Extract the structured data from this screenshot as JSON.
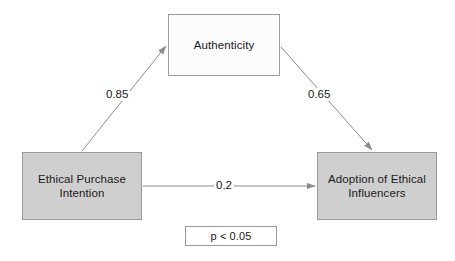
{
  "diagram": {
    "type": "path-diagram",
    "background_color": "#ffffff",
    "node_fill_shaded": "#cfcfcf",
    "node_fill_light": "#fbfbfb",
    "node_border_color": "#9a9a9a",
    "edge_color": "#8c8c8c",
    "text_color": "#1a1a1a",
    "nodes": [
      {
        "id": "authenticity",
        "label": "Authenticity",
        "role": "mediator"
      },
      {
        "id": "ethical_purchase_intention",
        "label": "Ethical Purchase\nIntention",
        "role": "predictor"
      },
      {
        "id": "adoption_of_ethical_influencers",
        "label": "Adoption of Ethical\nInfluencers",
        "role": "outcome"
      }
    ],
    "edges": [
      {
        "id": "epi_to_authenticity",
        "from": "ethical_purchase_intention",
        "to": "authenticity",
        "coefficient": "0.85"
      },
      {
        "id": "authenticity_to_adoption",
        "from": "authenticity",
        "to": "adoption_of_ethical_influencers",
        "coefficient": "0.65"
      },
      {
        "id": "epi_to_adoption",
        "from": "ethical_purchase_intention",
        "to": "adoption_of_ethical_influencers",
        "coefficient": "0.2"
      }
    ],
    "significance_note": "p < 0.05"
  }
}
